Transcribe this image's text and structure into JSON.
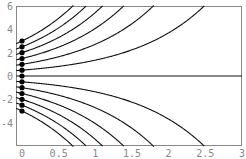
{
  "chart_data": {
    "type": "line",
    "title": "",
    "xlabel": "",
    "ylabel": "",
    "xlim": [
      -0.08,
      3
    ],
    "ylim": [
      -6,
      6
    ],
    "grid": false,
    "x_ticks": [
      "0",
      "0.5",
      "1",
      "1.5",
      "2",
      "2.5",
      "3"
    ],
    "y_ticks": [
      "6",
      "4",
      "2",
      "0",
      "-2",
      "-4"
    ],
    "function": "y = y0 * exp(x)",
    "initial_points": [
      3,
      2.5,
      2,
      1.5,
      1,
      0.5,
      0,
      -0.5,
      -1,
      -1.5,
      -2,
      -2.5,
      -3
    ],
    "series": [
      {
        "name": "y0=3",
        "y0": 3
      },
      {
        "name": "y0=2.5",
        "y0": 2.5
      },
      {
        "name": "y0=2",
        "y0": 2
      },
      {
        "name": "y0=1.5",
        "y0": 1.5
      },
      {
        "name": "y0=1",
        "y0": 1
      },
      {
        "name": "y0=0.5",
        "y0": 0.5
      },
      {
        "name": "y0=0",
        "y0": 0
      },
      {
        "name": "y0=-0.5",
        "y0": -0.5
      },
      {
        "name": "y0=-1",
        "y0": -1
      },
      {
        "name": "y0=-1.5",
        "y0": -1.5
      },
      {
        "name": "y0=-2",
        "y0": -2
      },
      {
        "name": "y0=-2.5",
        "y0": -2.5
      },
      {
        "name": "y0=-3",
        "y0": -3
      }
    ]
  }
}
